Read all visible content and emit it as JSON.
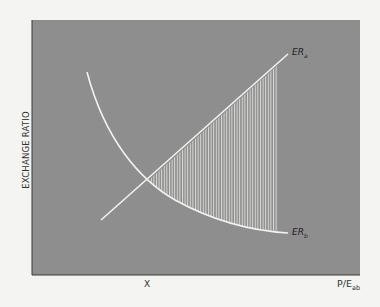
{
  "chart_data": {
    "type": "line",
    "title": "",
    "xlabel": "P/E_ab",
    "xlabel_main": "P/E",
    "xlabel_sub": "ab",
    "ylabel": "EXCHANGE RATIO",
    "x_ticks": [
      {
        "label": "X",
        "position": "intersection"
      }
    ],
    "grid": false,
    "legend": "inline labels at curve ends",
    "series": [
      {
        "name": "ER_a",
        "label_main": "ER",
        "label_sub": "a",
        "shape": "straight line, upward sloping",
        "points_px": [
          [
            101,
            220
          ],
          [
            288,
            54
          ]
        ]
      },
      {
        "name": "ER_b",
        "label_main": "ER",
        "label_sub": "b",
        "shape": "convex decreasing curve",
        "points_px": [
          [
            87,
            72
          ],
          [
            149,
            180
          ],
          [
            288,
            233
          ]
        ]
      }
    ],
    "annotations": [
      {
        "type": "hatched-region",
        "description": "Vertical hatched area between ER_a (above) and ER_b (below), from intersection X to right end",
        "x_range_px": [
          149,
          278
        ]
      }
    ],
    "intersection_px": [
      149,
      180
    ]
  },
  "colors": {
    "plot_background": "#8e8e8e",
    "curve": "#f2f2f0",
    "axis": "#3a3a3a",
    "page_background": "#f4f4f2"
  }
}
